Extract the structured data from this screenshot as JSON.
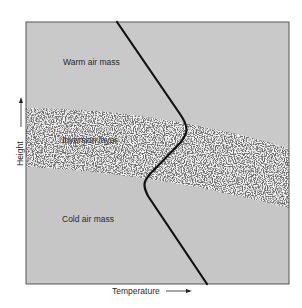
{
  "diagram": {
    "regions": [
      {
        "name": "warm-air-mass",
        "label": "Warm air mass",
        "fill": "#c9c9c9"
      },
      {
        "name": "inversion-layer",
        "label": "Inversion layer",
        "fill": "#f2f2f2",
        "pattern": "stippled"
      },
      {
        "name": "cold-air-mass",
        "label": "Cold air mass",
        "fill": "#c6c6c6"
      }
    ],
    "axes": {
      "x_label": "Temperature",
      "y_label": "Height",
      "x_arrow": "right",
      "y_arrow": "up"
    },
    "curve": {
      "description": "Temperature profile; decreases with height, increases (inversion) within the inversion layer",
      "color": "#111111"
    },
    "colors": {
      "border": "#555555",
      "background": "#ffffff"
    }
  }
}
